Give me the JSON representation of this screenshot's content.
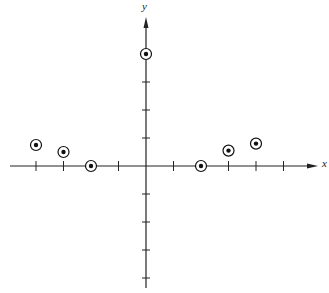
{
  "chart_data": {
    "type": "scatter",
    "title": "",
    "xlabel": "x",
    "ylabel": "y",
    "x_ticks": [
      -4,
      -3,
      -2,
      -1,
      1,
      2,
      3,
      4,
      5
    ],
    "y_ticks": [
      -4,
      -3,
      -2,
      -1,
      1,
      2,
      3
    ],
    "xlim": [
      -5,
      6.3
    ],
    "ylim": [
      -4.3,
      5.5
    ],
    "grid": false,
    "legend": null,
    "marker": "circled-dot",
    "series": [
      {
        "name": "points",
        "x": [
          -4,
          -3,
          -2,
          0,
          2,
          3,
          4
        ],
        "y": [
          0.75,
          0.5,
          0,
          4,
          0,
          0.55,
          0.8
        ]
      }
    ]
  },
  "colors": {
    "axis": "#222222",
    "marker": "#111111",
    "background": "#ffffff"
  }
}
